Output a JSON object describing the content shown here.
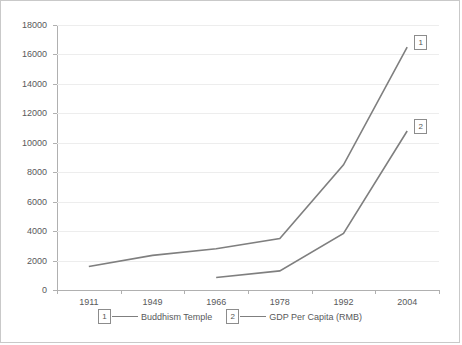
{
  "chart_data": {
    "type": "line",
    "title": "",
    "xlabel": "",
    "ylabel": "",
    "categories": [
      "1911",
      "1949",
      "1966",
      "1978",
      "1992",
      "2004"
    ],
    "ylim": [
      0,
      18000
    ],
    "ytick_labels": [
      "0",
      "2000",
      "4000",
      "6000",
      "8000",
      "10000",
      "12000",
      "14000",
      "16000",
      "18000"
    ],
    "ytick_values": [
      0,
      2000,
      4000,
      6000,
      8000,
      10000,
      12000,
      14000,
      16000,
      18000
    ],
    "grid": "horizontal",
    "legend_position": "bottom",
    "series": [
      {
        "name": "Buddhism Temple",
        "key": "1",
        "color": "#7f7f7f",
        "x": [
          "1911",
          "1949",
          "1966",
          "1978",
          "1992",
          "2004"
        ],
        "values": [
          1600,
          2350,
          2800,
          3500,
          8500,
          16500
        ]
      },
      {
        "name": "GDP Per Capita (RMB)",
        "key": "2",
        "color": "#7f7f7f",
        "x": [
          "1966",
          "1978",
          "1992",
          "2004"
        ],
        "values": [
          850,
          1300,
          3850,
          10800
        ]
      }
    ]
  },
  "legend": {
    "items": [
      {
        "key": "1",
        "label": "Buddhism Temple"
      },
      {
        "key": "2",
        "label": "GDP Per Capita (RMB)"
      }
    ]
  },
  "end_markers": [
    {
      "key": "1",
      "series": "Buddhism Temple"
    },
    {
      "key": "2",
      "series": "GDP Per Capita (RMB)"
    }
  ]
}
